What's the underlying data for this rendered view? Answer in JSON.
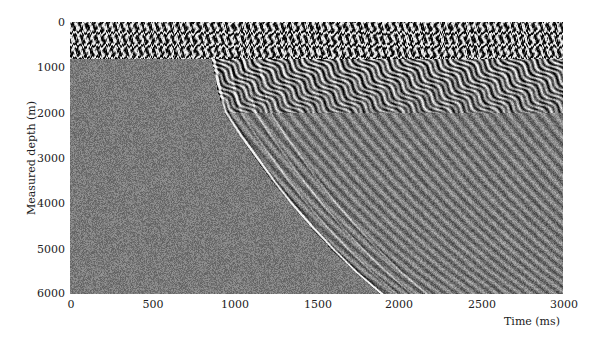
{
  "chart_data": {
    "type": "heatmap",
    "subtype": "seismic-vsp-wiggle-density",
    "title": "",
    "xlabel": "Time (ms)",
    "ylabel": "Measured depth (m)",
    "xlim": [
      0,
      3000
    ],
    "ylim": [
      6000,
      0
    ],
    "y_inverted": true,
    "grid": false,
    "legend": null,
    "x_ticks": [
      0,
      500,
      1000,
      1500,
      2000,
      2500,
      3000
    ],
    "y_ticks": [
      0,
      1000,
      2000,
      3000,
      4000,
      5000,
      6000
    ],
    "x_tick_labels": [
      "0",
      "500",
      "1000",
      "1500",
      "2000",
      "2500",
      "3000"
    ],
    "y_tick_labels": [
      "0",
      "1000",
      "2000",
      "3000",
      "4000",
      "5000",
      "6000"
    ],
    "colormap": "grayscale (black-white, gray = zero amplitude)",
    "regions": [
      {
        "name": "high-amplitude noise band",
        "depth_range_m": [
          0,
          800
        ],
        "time_range_ms": [
          0,
          3000
        ]
      },
      {
        "name": "pre-arrival background noise",
        "depth_range_m": [
          800,
          6000
        ],
        "time_range_ms": [
          0,
          "first_arrival"
        ]
      },
      {
        "name": "strong scattered reflections",
        "depth_range_m": [
          800,
          2000
        ],
        "time_range_ms": [
          "first_arrival",
          3000
        ]
      }
    ],
    "first_arrival": {
      "depth_m": [
        800,
        1000,
        1500,
        2000,
        2500,
        3000,
        3500,
        4000,
        4500,
        5000,
        5500,
        6000
      ],
      "time_ms": [
        870,
        885,
        910,
        950,
        1040,
        1140,
        1240,
        1350,
        1470,
        1600,
        1740,
        1900
      ]
    },
    "parallel_arrivals_offset_ms": [
      0,
      90,
      180,
      270
    ]
  }
}
